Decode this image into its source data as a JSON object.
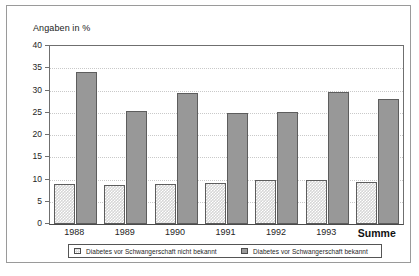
{
  "chart_data": {
    "type": "bar",
    "title": "",
    "xlabel": "",
    "ylabel": "Angaben in %",
    "ylim": [
      0,
      40
    ],
    "ytick_step": 5,
    "yticks": [
      "40",
      "35",
      "30",
      "25",
      "20",
      "15",
      "10",
      "5",
      "0"
    ],
    "grid": true,
    "legend_position": "bottom",
    "categories": [
      "1988",
      "1989",
      "1990",
      "1991",
      "1992",
      "1993",
      "Summe"
    ],
    "emphasized_category": "Summe",
    "series": [
      {
        "name": "Diabetes vor Schwangerschaft nicht bekannt",
        "color": "#d6d6d6",
        "pattern": "dotted",
        "values": [
          9.0,
          8.7,
          8.9,
          9.2,
          10.0,
          10.0,
          9.5
        ]
      },
      {
        "name": "Diabetes vor Schwangerschaft bekannt",
        "color": "#989898",
        "pattern": "solid",
        "values": [
          34.1,
          25.5,
          29.5,
          24.9,
          25.2,
          29.6,
          28.0
        ]
      }
    ]
  },
  "colors": {
    "frame": "#9a9a9a",
    "axis": "#6f6f6f",
    "grid": "#c9c9c9",
    "text": "#242424",
    "light_series": "#d6d6d6",
    "dark_series": "#989898",
    "bar_outline": "#5d5d5d"
  }
}
